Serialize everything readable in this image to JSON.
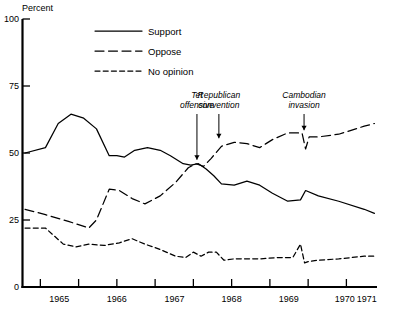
{
  "chart_data": {
    "type": "line",
    "title": "",
    "subtitle": "",
    "ylabel": "Percent",
    "xlabel": "",
    "ylim": [
      0,
      100
    ],
    "yticks": [
      0,
      25,
      50,
      75,
      100
    ],
    "xlim": [
      1964.3,
      1971.25
    ],
    "xticks": [
      1965,
      1966,
      1967,
      1968,
      1969,
      1970,
      1971
    ],
    "xtick_labels": [
      "1965",
      "1966",
      "1967",
      "1968",
      "1969",
      "1970",
      "1971"
    ],
    "grid": false,
    "legend_position": "top-center",
    "legend": [
      "Support",
      "Oppose",
      "No opinion"
    ],
    "series": [
      {
        "name": "Support",
        "dash": "solid",
        "x": [
          1964.35,
          1964.75,
          1965.0,
          1965.25,
          1965.5,
          1965.75,
          1966.0,
          1966.15,
          1966.3,
          1966.5,
          1966.75,
          1967.0,
          1967.2,
          1967.45,
          1967.6,
          1967.75,
          1967.9,
          1968.05,
          1968.2,
          1968.45,
          1968.7,
          1968.95,
          1969.2,
          1969.5,
          1969.75,
          1969.85,
          1970.1,
          1970.5,
          1971.0,
          1971.2
        ],
        "values": [
          50,
          52,
          61,
          64.5,
          63,
          59,
          49,
          49,
          48.5,
          51,
          52,
          51,
          49,
          46,
          45.5,
          46,
          44,
          41.5,
          38.5,
          38,
          39.5,
          38,
          35,
          32,
          32.5,
          36,
          34,
          32,
          29,
          27.5
        ]
      },
      {
        "name": "Oppose",
        "dash": "long",
        "x": [
          1964.35,
          1964.75,
          1965.2,
          1965.6,
          1965.75,
          1966.0,
          1966.2,
          1966.45,
          1966.7,
          1967.0,
          1967.3,
          1967.55,
          1967.7,
          1967.85,
          1968.0,
          1968.2,
          1968.45,
          1968.7,
          1968.95,
          1969.2,
          1969.5,
          1969.7,
          1969.78,
          1969.85,
          1969.92,
          1970.1,
          1970.5,
          1971.0,
          1971.2
        ],
        "values": [
          29,
          27,
          24.5,
          22,
          25,
          36.5,
          36,
          33,
          31,
          34,
          39,
          44.5,
          46,
          45,
          48,
          52.5,
          54,
          53.5,
          52,
          55,
          57.5,
          57.5,
          57.5,
          51.5,
          56,
          56,
          57,
          60,
          61
        ]
      },
      {
        "name": "No opinion",
        "dash": "short",
        "x": [
          1964.35,
          1964.75,
          1965.1,
          1965.35,
          1965.6,
          1965.9,
          1966.2,
          1966.45,
          1966.7,
          1967.0,
          1967.3,
          1967.5,
          1967.65,
          1967.8,
          1967.95,
          1968.1,
          1968.25,
          1968.45,
          1968.7,
          1968.95,
          1969.3,
          1969.6,
          1969.75,
          1969.83,
          1969.9,
          1970.1,
          1970.5,
          1971.0,
          1971.2
        ],
        "values": [
          22,
          22,
          16,
          15,
          16,
          15.5,
          16.5,
          18,
          16,
          14,
          11.5,
          11,
          13,
          11.5,
          13,
          13,
          10,
          10.5,
          10.5,
          10.5,
          11,
          11,
          16,
          9,
          9.5,
          10,
          10.5,
          11.5,
          11.5
        ]
      }
    ],
    "annotations": [
      {
        "label_line1": "Tet",
        "label_line2": "offensive",
        "x": 1967.72,
        "y_target": 46
      },
      {
        "label_line1": "Republican",
        "label_line2": "convention",
        "x": 1968.15,
        "y_target": 54
      },
      {
        "label_line1": "Cambodian",
        "label_line2": "invasion",
        "x": 1969.82,
        "y_target": 57
      }
    ]
  },
  "accent_color": "#000000",
  "background_color": "#ffffff"
}
